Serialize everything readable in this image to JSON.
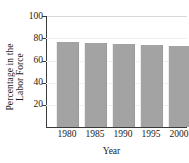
{
  "chart_data": {
    "type": "bar",
    "title": "",
    "xlabel": "Year",
    "ylabel": "Percentage in the Labor Force",
    "ylabel_line1": "Percentage in the",
    "ylabel_line2": "Labor Force",
    "categories": [
      "1980",
      "1985",
      "1990",
      "1995",
      "2000"
    ],
    "values": [
      77,
      76,
      75,
      74,
      73
    ],
    "yticks": [
      100,
      80,
      60,
      40,
      20
    ],
    "ytick_labels": [
      "100",
      "80",
      "60",
      "40",
      "20"
    ],
    "ylim": [
      0,
      100
    ],
    "grid": false,
    "legend": null,
    "bar_color": "#a3a3a3",
    "axis_color": "#3a3a3a",
    "background": "#ffffff"
  }
}
